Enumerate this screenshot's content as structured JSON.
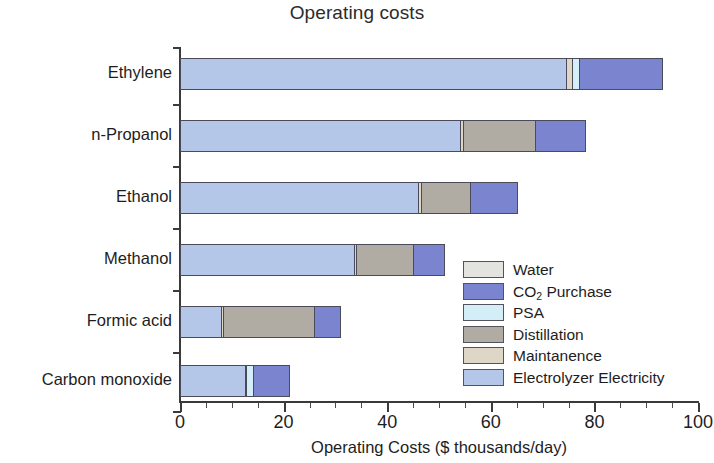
{
  "chart_data": {
    "type": "bar",
    "orientation": "horizontal",
    "stacked": true,
    "title": "Operating costs",
    "xlabel": "Operating Costs ($ thousands/day)",
    "ylabel": "",
    "xlim": [
      0,
      100
    ],
    "xticks": [
      0,
      20,
      40,
      60,
      80,
      100
    ],
    "xtick_labels": [
      "0",
      "20",
      "40",
      "60",
      "80",
      "100"
    ],
    "minor_tick_interval": 5,
    "grid": false,
    "legend_position": "center-right inside plot",
    "categories": [
      "Ethylene",
      "n-Propanol",
      "Ethanol",
      "Methanol",
      "Formic acid",
      "Carbon monoxide"
    ],
    "series": [
      {
        "name": "Electrolyzer Electricity",
        "color": "#b5c7e8",
        "values": [
          74.5,
          54.0,
          46.0,
          33.5,
          8.0,
          12.5
        ]
      },
      {
        "name": "Maintanence",
        "color": "#ded6c6",
        "values": [
          1.2,
          0.6,
          0.5,
          0.4,
          0.3,
          0.3
        ]
      },
      {
        "name": "Distillation",
        "color": "#b0aca3",
        "values": [
          0.0,
          14.0,
          9.5,
          11.0,
          17.5,
          0.0
        ]
      },
      {
        "name": "PSA",
        "color": "#d3eef6",
        "values": [
          1.3,
          0.0,
          0.0,
          0.0,
          0.0,
          1.2
        ]
      },
      {
        "name": "CO2 Purchase",
        "color": "#7b85cf",
        "values": [
          16.0,
          9.5,
          9.0,
          6.0,
          5.0,
          7.0
        ]
      },
      {
        "name": "Water",
        "color": "#e3e3e0",
        "values": [
          0.0,
          0.0,
          0.0,
          0.0,
          0.0,
          0.0
        ]
      }
    ],
    "totals": [
      93.0,
      78.1,
      65.0,
      50.9,
      30.8,
      21.0
    ]
  },
  "legend": {
    "items": [
      {
        "label": "Water",
        "label_sub": "",
        "label_tail": "",
        "color": "#e3e3e0"
      },
      {
        "label": "CO",
        "label_sub": "2",
        "label_tail": " Purchase",
        "color": "#7b85cf"
      },
      {
        "label": "PSA",
        "label_sub": "",
        "label_tail": "",
        "color": "#d3eef6"
      },
      {
        "label": "Distillation",
        "label_sub": "",
        "label_tail": "",
        "color": "#b0aca3"
      },
      {
        "label": "Maintanence",
        "label_sub": "",
        "label_tail": "",
        "color": "#ded6c6"
      },
      {
        "label": "Electrolyzer Electricity",
        "label_sub": "",
        "label_tail": "",
        "color": "#b5c7e8"
      }
    ]
  },
  "colors": {
    "water": "#e3e3e0",
    "co2_purchase": "#7b85cf",
    "psa": "#d3eef6",
    "distillation": "#b0aca3",
    "maintanence": "#ded6c6",
    "electrolyzer_electricity": "#b5c7e8",
    "axis": "#3a3a3a",
    "text": "#1d1d1d",
    "background": "#ffffff"
  }
}
